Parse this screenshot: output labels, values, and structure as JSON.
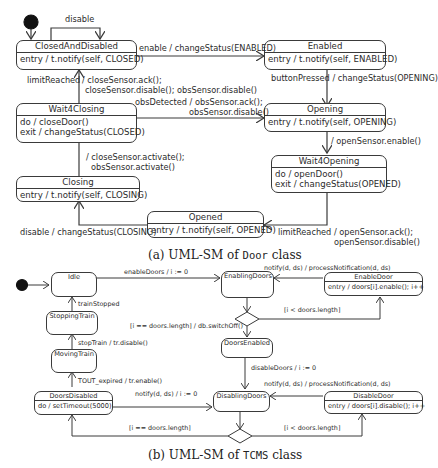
{
  "diagram_a": {
    "caption_prefix": "(a) UML-SM of ",
    "caption_class": "Door",
    "caption_suffix": " class",
    "states": {
      "closed_and_disabled": {
        "name": "ClosedAndDisabled",
        "body": [
          "entry / t.notify(self, CLOSED)"
        ]
      },
      "enabled": {
        "name": "Enabled",
        "body": [
          "entry / t.notify(self, ENABLED)"
        ]
      },
      "wait4closing": {
        "name": "Wait4Closing",
        "body": [
          "do / closeDoor()",
          "exit / changeStatus(CLOSED)"
        ]
      },
      "opening": {
        "name": "Opening",
        "body": [
          "entry / t.notify(self, OPENING)"
        ]
      },
      "wait4opening": {
        "name": "Wait4Opening",
        "body": [
          "do / openDoor()",
          "exit / changeStatus(OPENED)"
        ]
      },
      "closing": {
        "name": "Closing",
        "body": [
          "entry / t.notify(self, CLOSING)"
        ]
      },
      "opened": {
        "name": "Opened",
        "body": [
          "entry / t.notify(self, OPENED)"
        ]
      }
    },
    "transitions": {
      "disable_self": "disable",
      "enable": "enable / changeStatus(ENABLED)",
      "button_pressed": "buttonPressed / changeStatus(OPENING)",
      "limit_reached_close_1": "limitReached",
      "limit_reached_close_2": "/ closeSensor.ack();",
      "limit_reached_close_3": "closeSensor.disable(); obsSensor.disable()",
      "obs_detected_1": "obsDetected / obsSensor.ack();",
      "obs_detected_2": "obsSensor.disable()",
      "open_sensor_enable": "/ openSensor.enable()",
      "close_sensor_activate_1": "/ closeSensor.activate();",
      "close_sensor_activate_2": "obsSensor.activate()",
      "disable_closing": "disable / changeStatus(CLOSING)",
      "limit_reached_open_1": "limitReached / openSensor.ack();",
      "limit_reached_open_2": "openSensor.disable()"
    }
  },
  "diagram_b": {
    "caption_prefix": "(b) UML-SM of ",
    "caption_class": "TCMS",
    "caption_suffix": " class",
    "states": {
      "idle": {
        "name": "Idle"
      },
      "enabling_doors": {
        "name": "EnablingDoors"
      },
      "enable_door": {
        "name": "EnableDoor",
        "body": [
          "entry / doors[i].enable(); i++"
        ]
      },
      "stopping_train": {
        "name": "StoppingTrain"
      },
      "doors_enabled": {
        "name": "DoorsEnabled"
      },
      "moving_train": {
        "name": "MovingTrain"
      },
      "doors_disabled": {
        "name": "DoorsDisabled",
        "body": [
          "do / setTimeout(5000)"
        ]
      },
      "disabling_doors": {
        "name": "DisablingDoors"
      },
      "disable_door": {
        "name": "DisableDoor",
        "body": [
          "entry / doors[i].disable(); i++"
        ]
      }
    },
    "transitions": {
      "enable_doors": "enableDoors / i := 0",
      "notify_enable": "notify(d, ds) / processNotification(d, ds)",
      "i_lt_len_top": "[i < doors.length]",
      "i_eq_len_top": "[i == doors.length] / db.switchOff()",
      "train_stopped": "trainStopped",
      "stop_train": "stopTrain / tr.disable()",
      "tout_expired": "TOUT_expired / tr.enable()",
      "disable_doors": "disableDoors / i := 0",
      "notify_disable_1": "notify(d, ds) / i := 0",
      "notify_disable_2": "notify(d, ds) / processNotification(d, ds)",
      "i_eq_len_bottom": "[i == doors.length]",
      "i_lt_len_bottom": "[i < doors.length]"
    }
  }
}
